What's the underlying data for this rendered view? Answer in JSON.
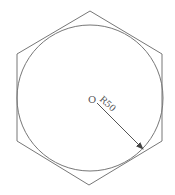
{
  "diagram": {
    "type": "geometry",
    "stroke_color": "#777777",
    "center_label": "O",
    "radius_label": "R50",
    "hexagon": {
      "points": [
        [
          90,
          11
        ],
        [
          162,
          54
        ],
        [
          162,
          141
        ],
        [
          89,
          185
        ],
        [
          17,
          141
        ],
        [
          17,
          54
        ]
      ]
    },
    "circle": {
      "cx": 90,
      "cy": 98,
      "r": 73
    },
    "radius_arrow": {
      "x1": 97,
      "y1": 103,
      "x2": 143,
      "y2": 149
    }
  }
}
